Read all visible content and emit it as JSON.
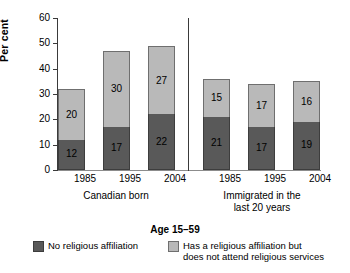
{
  "chart_data": {
    "type": "bar",
    "stacked": true,
    "title": "",
    "subtitle": "",
    "xlabel": "",
    "ylabel": "Per cent",
    "ylim": [
      0,
      60
    ],
    "yticks": [
      0,
      10,
      20,
      30,
      40,
      50,
      60
    ],
    "grid": false,
    "legend_position": "bottom",
    "annotation": "Age 15–59",
    "groups": [
      {
        "name": "Canadian born",
        "categories": [
          "1985",
          "1995",
          "2004"
        ]
      },
      {
        "name": "Immigrated in the\nlast 20 years",
        "name_line1": "Immigrated in the",
        "name_line2": "last 20 years",
        "categories": [
          "1985",
          "1995",
          "2004"
        ]
      }
    ],
    "categories": [
      "1985",
      "1995",
      "2004",
      "1985",
      "1995",
      "2004"
    ],
    "series": [
      {
        "name": "No religious affiliation",
        "color": "#595959",
        "values": [
          12,
          17,
          22,
          21,
          17,
          19
        ]
      },
      {
        "name": "Has a religious affiliation but does not attend religious services",
        "color": "#b9b9b9",
        "values": [
          20,
          30,
          27,
          15,
          17,
          16
        ]
      }
    ],
    "totals": [
      32,
      47,
      49,
      36,
      34,
      35
    ]
  },
  "axis": {
    "y_ticks": [
      "0",
      "10",
      "20",
      "30",
      "40",
      "50",
      "60"
    ],
    "y_title": "Per cent"
  },
  "bars": [
    {
      "id": "canadian-1985",
      "x_label": "1985",
      "bottom_value": "12",
      "top_value": "20",
      "bottom": 12,
      "top": 20
    },
    {
      "id": "canadian-1995",
      "x_label": "1995",
      "bottom_value": "17",
      "top_value": "30",
      "bottom": 17,
      "top": 30
    },
    {
      "id": "canadian-2004",
      "x_label": "2004",
      "bottom_value": "22",
      "top_value": "27",
      "bottom": 22,
      "top": 27
    },
    {
      "id": "immigrated-1985",
      "x_label": "1985",
      "bottom_value": "21",
      "top_value": "15",
      "bottom": 21,
      "top": 15
    },
    {
      "id": "immigrated-1995",
      "x_label": "1995",
      "bottom_value": "17",
      "top_value": "17",
      "bottom": 17,
      "top": 17
    },
    {
      "id": "immigrated-2004",
      "x_label": "2004",
      "bottom_value": "19",
      "top_value": "16",
      "bottom": 19,
      "top": 16
    }
  ],
  "groups": {
    "canadian_born": "Canadian born",
    "immigrated_line1": "Immigrated in the",
    "immigrated_line2": "last 20 years"
  },
  "age_label": "Age 15–59",
  "legend": {
    "items": [
      {
        "label": "No religious affiliation",
        "color": "#595959"
      },
      {
        "label_line1": "Has a religious affiliation but",
        "label_line2": "does not attend religious services",
        "color": "#b9b9b9"
      }
    ]
  },
  "colors": {
    "no_affiliation": "#595959",
    "has_affiliation": "#b9b9b9",
    "axis": "#3a3a3a",
    "background": "#ffffff"
  }
}
